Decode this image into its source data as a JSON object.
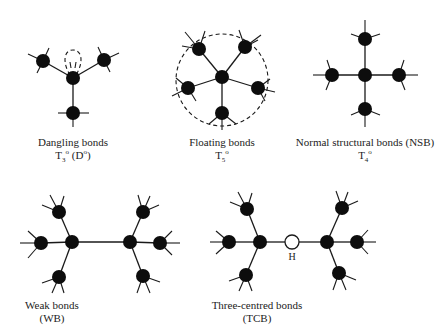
{
  "figure": {
    "panels": [
      {
        "id": "dangling",
        "title": "Dangling bonds",
        "symbol_main": "T",
        "symbol_sub": "3",
        "symbol_sup": "o",
        "symbol_extra": "(D",
        "symbol_extra_sup": "o",
        "symbol_extra_close": ")"
      },
      {
        "id": "floating",
        "title": "Floating bonds",
        "symbol_main": "T",
        "symbol_sub": "5",
        "symbol_sup": "o"
      },
      {
        "id": "nsb",
        "title": "Normal structural bonds (NSB)",
        "symbol_main": "T",
        "symbol_sub": "4",
        "symbol_sup": "o"
      },
      {
        "id": "wb",
        "title": "Weak bonds",
        "subtitle": "(WB)"
      },
      {
        "id": "tcb",
        "title": "Three-centred bonds",
        "subtitle": "(TCB)",
        "hydrogen_label": "H"
      }
    ],
    "colors": {
      "atom": "#0d0d0d",
      "bond": "#1a1a1a",
      "hydrogen_fill": "#ffffff",
      "background": "#ffffff"
    }
  }
}
